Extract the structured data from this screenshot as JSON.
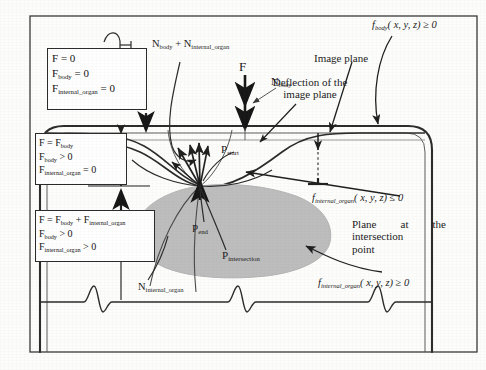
{
  "figure": {
    "outer_frame": true
  },
  "boxes": [
    {
      "id": "box-zero-force",
      "lines": [
        "F = 0",
        "Fbody = 0",
        "Finternal_organ = 0"
      ],
      "line1_main": "F",
      "line1_rest": " = 0",
      "line2_main": "F",
      "line2_sub": "body",
      "line2_rest": " = 0",
      "line3_main": "F",
      "line3_sub": "internal_organ",
      "line3_rest": " = 0"
    },
    {
      "id": "box-body-force",
      "line1_main": "F = F",
      "line1_sub": "body",
      "line1_rest": "",
      "line2_main": "F",
      "line2_sub": "body",
      "line2_rest": " > 0",
      "line3_main": "F",
      "line3_sub": "internal_organ",
      "line3_rest": " = 0"
    },
    {
      "id": "box-combined-force",
      "line1_main": "F = F",
      "line1_sub": "body",
      "line1_mid": " + F",
      "line1_sub2": "internal_organ",
      "line2_main": "F",
      "line2_sub": "body",
      "line2_rest": " > 0",
      "line3_main": "F",
      "line3_sub": "internal_organ",
      "line3_rest": " > 0"
    }
  ],
  "labels": {
    "normal_sum_main1": "N",
    "normal_sum_sub1": "body",
    "normal_sum_plus": " + N",
    "normal_sum_sub2": "internal_organ",
    "force_f": "F",
    "normal_body_main": "N",
    "normal_body_sub": "body",
    "normal_internal_main": "N",
    "normal_internal_sub": "internal_organ",
    "image_plane": "Image plane",
    "deflection_line1": "Deflection of the",
    "deflection_line2": "image plane",
    "f_body_expr": "fbody( x, y, z) ≥ 0",
    "f_body_name": "f",
    "f_body_sub": "body",
    "f_body_rest": "( x, y, z) ≥ 0",
    "f_internal_le_name": "f",
    "f_internal_le_sub": "internal_organ",
    "f_internal_le_rest": "( x, y, z) ≤ 0",
    "f_internal_ge_name": "f",
    "f_internal_ge_sub": "internal_organ",
    "f_internal_ge_rest": "( x, y, z) ≥ 0",
    "plane_line1": "Plane",
    "plane_line2": "at",
    "plane_line3": "the",
    "plane_line4": "intersection",
    "plane_line5": "point",
    "p_start_main": "P",
    "p_start_sub": "start",
    "p_end_main": "P",
    "p_end_sub": "end",
    "p_intersection_main": "P",
    "p_intersection_sub": "intersection"
  },
  "colors": {
    "ink": "#1a1a1a",
    "stroke": "#2d2d2d",
    "organ_fill": "#bdbdbd",
    "organ_stroke": "#b0b0b0",
    "thin_line": "#7a7a7a",
    "paper": "#fdfdfc"
  }
}
